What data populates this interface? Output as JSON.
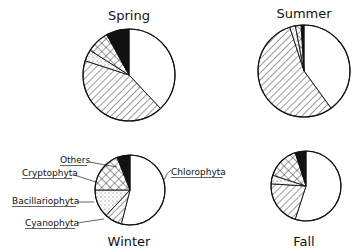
{
  "chart_data": [
    {
      "type": "pie",
      "title": "Spring",
      "categories": [
        "Chlorophyta",
        "Cyanophyta",
        "Bacillariophyta",
        "Cryptophyta",
        "Others"
      ],
      "values": [
        38,
        42,
        4,
        8,
        8
      ],
      "unit": "%"
    },
    {
      "type": "pie",
      "title": "Summer",
      "categories": [
        "Chlorophyta",
        "Cyanophyta",
        "Bacillariophyta",
        "Cryptophyta",
        "Others"
      ],
      "values": [
        40,
        55,
        2,
        2,
        1
      ],
      "unit": "%"
    },
    {
      "type": "pie",
      "title": "Winter",
      "categories": [
        "Chlorophyta",
        "Cyanophyta",
        "Bacillariophyta",
        "Cryptophyta",
        "Others"
      ],
      "values": [
        54,
        8,
        13,
        19,
        6
      ],
      "unit": "%"
    },
    {
      "type": "pie",
      "title": "Fall",
      "categories": [
        "Chlorophyta",
        "Cyanophyta",
        "Bacillariophyta",
        "Cryptophyta",
        "Others"
      ],
      "values": [
        55,
        21,
        4,
        15,
        5
      ],
      "unit": "%"
    }
  ],
  "legend": {
    "others": "Others",
    "cryptophyta": "Cryptophyta",
    "bacillariophyta": "Bacillariophyta",
    "cyanophyta": "Cyanophyta",
    "chlorophyta": "Chlorophyta"
  },
  "patterns": {
    "Chlorophyta": "white",
    "Cyanophyta": "diagonal-hatch",
    "Bacillariophyta": "dots",
    "Cryptophyta": "crosshatch",
    "Others": "black"
  },
  "layout": {
    "pies": [
      {
        "cx": 129,
        "cy": 75,
        "r": 46,
        "title_x": 129,
        "title_y": 20
      },
      {
        "cx": 304,
        "cy": 71,
        "r": 46,
        "title_x": 304,
        "title_y": 18
      },
      {
        "cx": 130,
        "cy": 190,
        "r": 35,
        "title_x": 129,
        "title_y": 244
      },
      {
        "cx": 306,
        "cy": 186,
        "r": 35,
        "title_x": 304,
        "title_y": 244
      }
    ]
  }
}
